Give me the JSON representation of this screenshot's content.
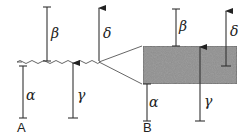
{
  "figure": {
    "panels": [
      {
        "id": "A",
        "label": "A",
        "description": "Rough wavy interface with four displacement vectors",
        "vectors": {
          "alpha": {
            "symbol": "α",
            "type": "bar"
          },
          "beta": {
            "symbol": "β",
            "type": "bar"
          },
          "gamma": {
            "symbol": "γ",
            "type": "arrow-up"
          },
          "delta": {
            "symbol": "δ",
            "type": "arrow-up"
          }
        }
      },
      {
        "id": "B",
        "label": "B",
        "description": "Magnified view of the interface as a shaded layer",
        "vectors": {
          "alpha": {
            "symbol": "α",
            "type": "bar"
          },
          "beta": {
            "symbol": "β",
            "type": "bar"
          },
          "gamma": {
            "symbol": "γ",
            "type": "arrow-up"
          },
          "delta": {
            "symbol": "δ",
            "type": "arrow-up"
          }
        }
      }
    ],
    "colors": {
      "line": "#333333",
      "layer_fill": "#8c8c8c",
      "background": "#ffffff"
    }
  }
}
